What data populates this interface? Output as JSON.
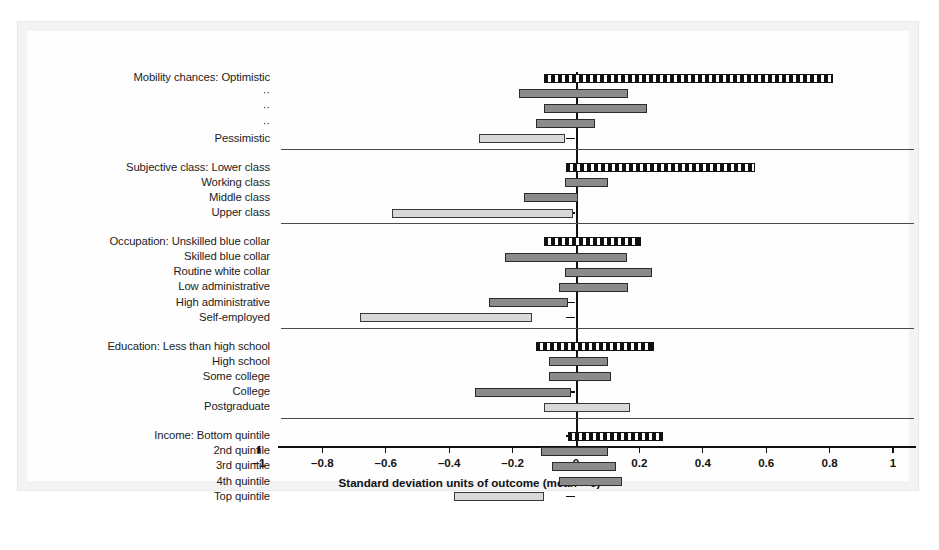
{
  "chart_data": {
    "type": "bar",
    "orientation": "horizontal",
    "title": "",
    "xlabel": "Standard deviation units of outcome (mean = 0)",
    "ylabel": "",
    "xlim": [
      -1,
      1
    ],
    "xticks": [
      -1,
      -0.8,
      -0.6,
      -0.4,
      -0.2,
      0,
      0.2,
      0.4,
      0.6,
      0.8,
      1
    ],
    "xticklabels": [
      "–1",
      "–0.8",
      "–0.6",
      "–0.4",
      "–0.2",
      "0",
      "0.2",
      "0.4",
      "0.6",
      "0.8",
      "1"
    ],
    "grid": false,
    "legend": null,
    "zero_reference_line": 0,
    "note": "Each bar is a horizontal interval (range) spanning from low to high in standard deviation units. Reference categories are drawn with a black-and-white checkered fill; other categories are solid gray or light gray.",
    "groups": [
      {
        "name": "Mobility chances",
        "items": [
          {
            "label": "Mobility chances: Optimistic",
            "style": "reference",
            "low": -0.1,
            "high": 0.81
          },
          {
            "label": "··",
            "style": "mid",
            "low": -0.18,
            "high": 0.165
          },
          {
            "label": "··",
            "style": "mid",
            "low": -0.1,
            "high": 0.225
          },
          {
            "label": "··",
            "style": "mid",
            "low": -0.125,
            "high": 0.06
          },
          {
            "label": "Pessimistic",
            "style": "light",
            "low": -0.305,
            "high": -0.035
          }
        ]
      },
      {
        "name": "Subjective class",
        "items": [
          {
            "label": "Subjective class: Lower class",
            "style": "reference",
            "low": -0.03,
            "high": 0.565
          },
          {
            "label": "Working class",
            "style": "mid",
            "low": -0.035,
            "high": 0.1
          },
          {
            "label": "Middle class",
            "style": "mid",
            "low": -0.165,
            "high": 0.005
          },
          {
            "label": "Upper class",
            "style": "light",
            "low": -0.58,
            "high": -0.01
          }
        ]
      },
      {
        "name": "Occupation",
        "items": [
          {
            "label": "Occupation: Unskilled blue collar",
            "style": "reference",
            "low": -0.1,
            "high": 0.205
          },
          {
            "label": "Skilled blue collar",
            "style": "mid",
            "low": -0.225,
            "high": 0.16
          },
          {
            "label": "Routine white collar",
            "style": "mid",
            "low": -0.035,
            "high": 0.24
          },
          {
            "label": "Low administrative",
            "style": "mid",
            "low": -0.055,
            "high": 0.165
          },
          {
            "label": "High administrative",
            "style": "mid",
            "low": -0.275,
            "high": -0.025
          },
          {
            "label": "Self-employed",
            "style": "light",
            "low": -0.68,
            "high": -0.14
          }
        ]
      },
      {
        "name": "Education",
        "items": [
          {
            "label": "Education: Less than high school",
            "style": "reference",
            "low": -0.125,
            "high": 0.245
          },
          {
            "label": "High school",
            "style": "mid",
            "low": -0.085,
            "high": 0.1
          },
          {
            "label": "Some college",
            "style": "mid",
            "low": -0.085,
            "high": 0.11
          },
          {
            "label": "College",
            "style": "mid",
            "low": -0.32,
            "high": -0.015
          },
          {
            "label": "Postgraduate",
            "style": "light",
            "low": -0.1,
            "high": 0.17
          }
        ]
      },
      {
        "name": "Income",
        "items": [
          {
            "label": "Income: Bottom quintile",
            "style": "reference",
            "low": -0.025,
            "high": 0.275
          },
          {
            "label": "2nd quintile",
            "style": "mid",
            "low": -0.11,
            "high": 0.1
          },
          {
            "label": "3rd quintile",
            "style": "mid",
            "low": -0.075,
            "high": 0.125
          },
          {
            "label": "4th quintile",
            "style": "mid",
            "low": -0.055,
            "high": 0.145
          },
          {
            "label": "Top quintile",
            "style": "light",
            "low": -0.385,
            "high": -0.1
          }
        ]
      }
    ]
  },
  "caption": ""
}
